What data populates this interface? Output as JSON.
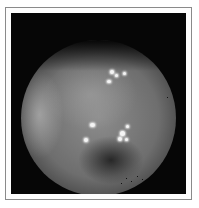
{
  "image": {
    "subject": "grayscale endoscopic view",
    "frame_color": "#8a8a8a",
    "background_color": "#060606",
    "glints": [
      {
        "x": 110,
        "y": 70,
        "w": 4,
        "h": 4
      },
      {
        "x": 115,
        "y": 74,
        "w": 3,
        "h": 3
      },
      {
        "x": 107,
        "y": 80,
        "w": 4,
        "h": 3
      },
      {
        "x": 123,
        "y": 72,
        "w": 3,
        "h": 3
      },
      {
        "x": 90,
        "y": 123,
        "w": 5,
        "h": 4
      },
      {
        "x": 84,
        "y": 138,
        "w": 4,
        "h": 4
      },
      {
        "x": 120,
        "y": 131,
        "w": 5,
        "h": 5
      },
      {
        "x": 126,
        "y": 125,
        "w": 3,
        "h": 3
      },
      {
        "x": 118,
        "y": 137,
        "w": 4,
        "h": 4
      },
      {
        "x": 125,
        "y": 138,
        "w": 3,
        "h": 3
      }
    ]
  }
}
